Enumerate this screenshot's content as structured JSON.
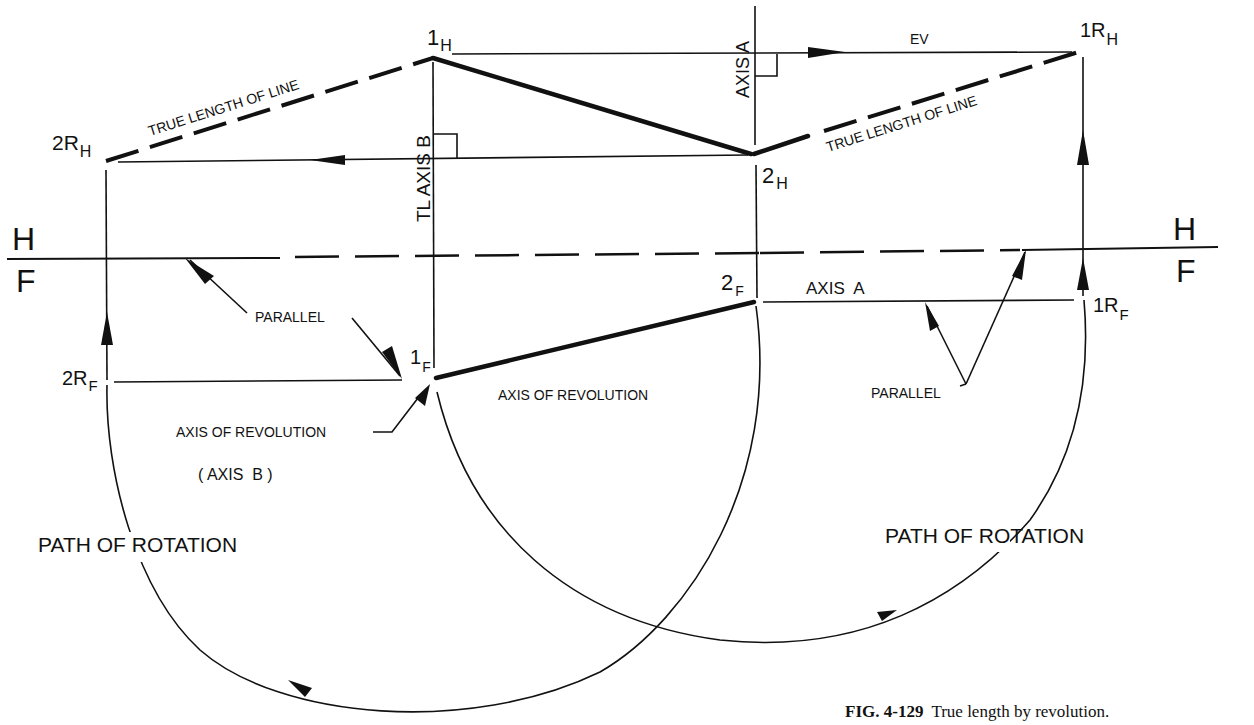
{
  "figure": {
    "caption_number": "FIG. 4-129",
    "caption_text": "True length by revolution."
  },
  "labels": {
    "point_1H": {
      "main": "1",
      "sub": "H"
    },
    "point_2H": {
      "main": "2",
      "sub": "H"
    },
    "point_1RH": {
      "main": "1R",
      "sub": "H"
    },
    "point_2RH": {
      "main": "2R",
      "sub": "H"
    },
    "point_1F": {
      "main": "1",
      "sub": "F"
    },
    "point_2F": {
      "main": "2",
      "sub": "F"
    },
    "point_1RF": {
      "main": "1R",
      "sub": "F"
    },
    "point_2RF": {
      "main": "2R",
      "sub": "F"
    },
    "plane_H_left": "H",
    "plane_F_left": "F",
    "plane_H_right": "H",
    "plane_F_right": "F",
    "true_length_left": "TRUE LENGTH OF LINE",
    "true_length_right": "TRUE LENGTH OF LINE",
    "tl_axis_b": "TL AXIS B",
    "axis_a_vertical": "AXIS A",
    "axis_a_front": "AXIS  A",
    "ev": "EV",
    "parallel_left": "PARALLEL",
    "parallel_right": "PARALLEL",
    "axis_of_revolution_left": "AXIS OF REVOLUTION",
    "axis_b_paren": "( AXIS  B )",
    "axis_of_revolution_center": "AXIS OF REVOLUTION",
    "path_of_rotation_left": "PATH OF ROTATION",
    "path_of_rotation_right": "PATH OF ROTATION"
  }
}
